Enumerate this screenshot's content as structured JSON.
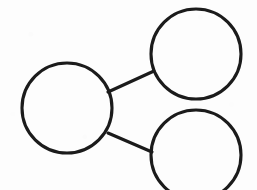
{
  "diagram": {
    "type": "node-link-graph",
    "canvas": {
      "width": 257,
      "height": 190,
      "background": "#fdfdfd"
    },
    "style": {
      "stroke_color": "#1b1b1b",
      "stroke_width": 3.1,
      "fill": "none",
      "appearance": "hand-drawn scanned ink on paper"
    },
    "nodes": [
      {
        "id": "left-node",
        "label": "",
        "cx": 67,
        "cy": 108,
        "r": 45,
        "position_description": "left, vertically centered"
      },
      {
        "id": "top-right-node",
        "label": "",
        "cx": 196,
        "cy": 54,
        "r": 45,
        "position_description": "upper right"
      },
      {
        "id": "bottom-right-node",
        "label": "",
        "cx": 196,
        "cy": 155,
        "r": 45,
        "position_description": "lower right, clipped by bottom edge"
      }
    ],
    "edges": [
      {
        "id": "edge-left-to-topright",
        "from": "left-node",
        "to": "top-right-node",
        "x1": 108,
        "y1": 92,
        "x2": 154,
        "y2": 71
      },
      {
        "id": "edge-left-to-bottomright",
        "from": "left-node",
        "to": "bottom-right-node",
        "x1": 108,
        "y1": 133,
        "x2": 152,
        "y2": 152
      }
    ]
  }
}
